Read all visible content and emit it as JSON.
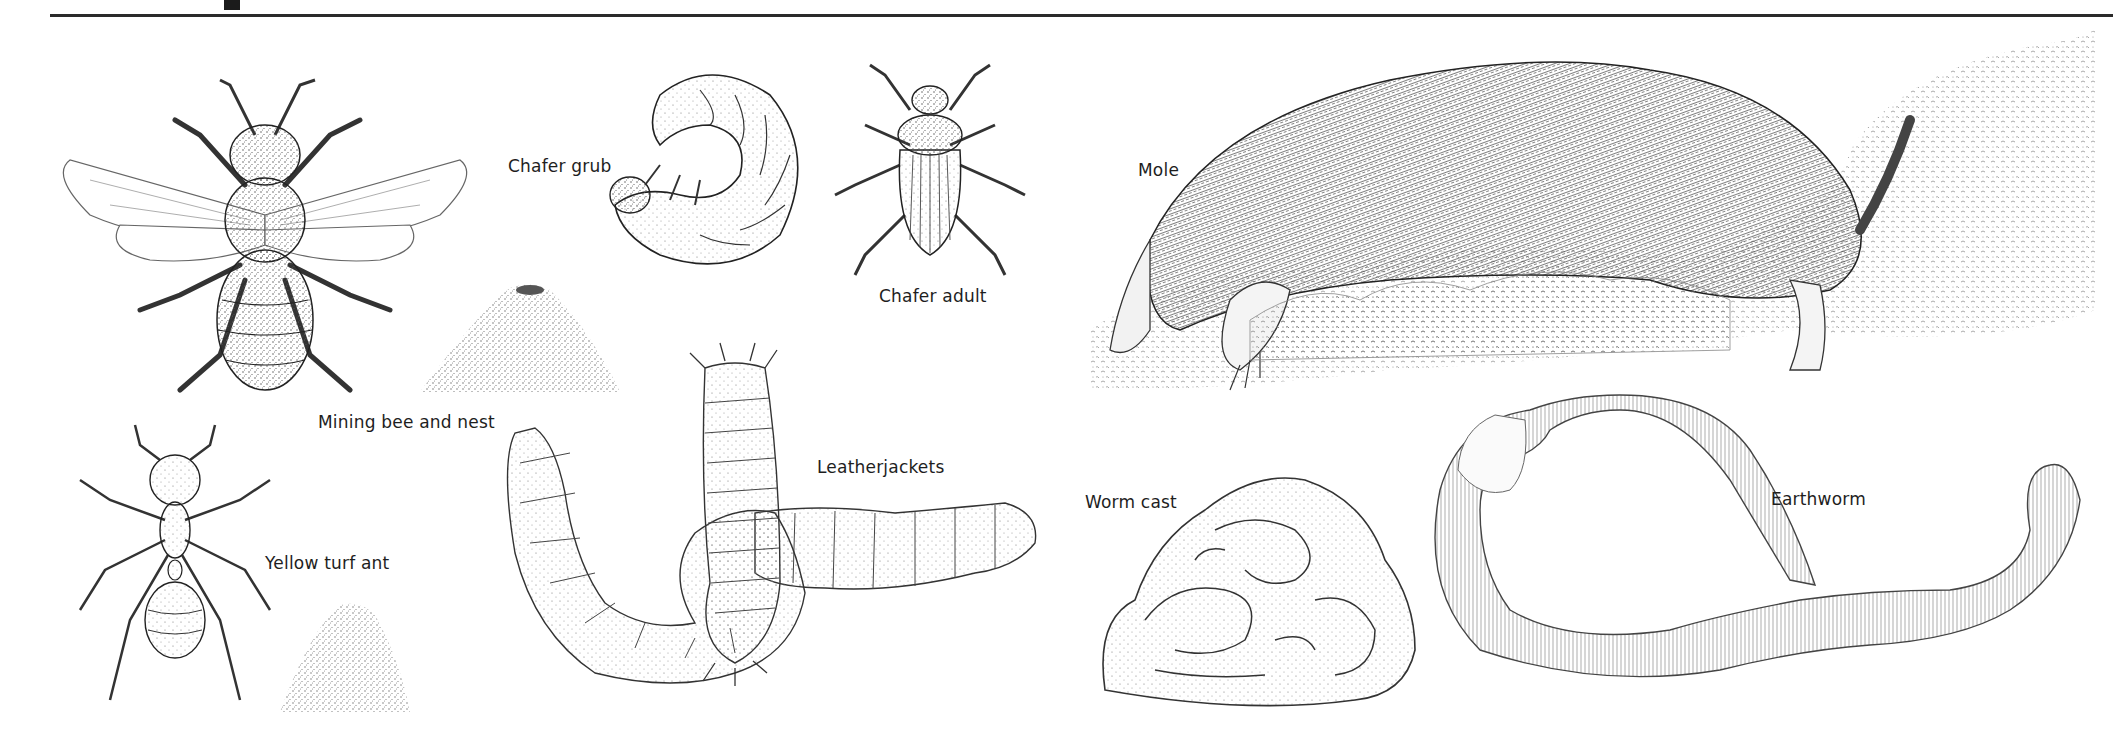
{
  "page": {
    "type": "illustrated field-guide plate",
    "header_rule": true,
    "title_fragment_visible": true
  },
  "illustrations": [
    {
      "id": "mining-bee",
      "label": "Mining bee and nest",
      "kind": "insect"
    },
    {
      "id": "bee-nest",
      "label": "",
      "kind": "soil mound"
    },
    {
      "id": "chafer-grub",
      "label": "Chafer grub",
      "kind": "larva"
    },
    {
      "id": "chafer-adult",
      "label": "Chafer adult",
      "kind": "beetle"
    },
    {
      "id": "mole",
      "label": "Mole",
      "kind": "mammal"
    },
    {
      "id": "yellow-turf-ant",
      "label": "Yellow turf ant",
      "kind": "insect"
    },
    {
      "id": "ant-hill",
      "label": "",
      "kind": "soil mound"
    },
    {
      "id": "leatherjackets",
      "label": "Leatherjackets",
      "kind": "larva"
    },
    {
      "id": "worm-cast",
      "label": "Worm cast",
      "kind": "soil cast"
    },
    {
      "id": "earthworm",
      "label": "Earthworm",
      "kind": "annelid"
    }
  ],
  "labels": {
    "mining_bee": "Mining bee and nest",
    "chafer_grub": "Chafer grub",
    "chafer_adult": "Chafer adult",
    "mole": "Mole",
    "yellow_turf_ant": "Yellow turf ant",
    "leatherjackets": "Leatherjackets",
    "worm_cast": "Worm cast",
    "earthworm": "Earthworm"
  },
  "colors": {
    "ink": "#1e1e1e",
    "paper": "#ffffff",
    "shade": "#8a8a8a"
  }
}
